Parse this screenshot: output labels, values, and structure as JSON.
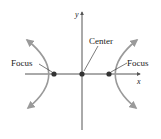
{
  "diagram": {
    "axes": {
      "x_label": "x",
      "y_label": "y"
    },
    "labels": {
      "center": "Center",
      "focus_left": "Focus",
      "focus_right": "Focus"
    },
    "colors": {
      "curve": "#9a9a9a",
      "axis": "#555555",
      "point": "#333333",
      "text": "#222222"
    }
  }
}
